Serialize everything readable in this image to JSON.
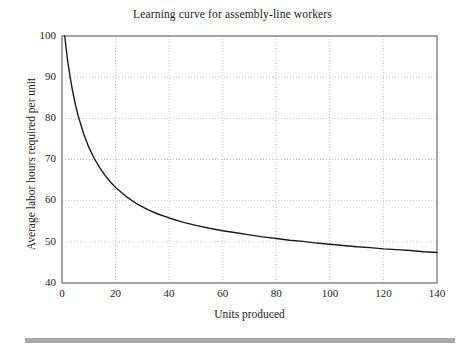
{
  "figure": {
    "title": "Learning curve for assembly-line workers",
    "footer_rule_color": "#a9a9a9"
  },
  "chart_data": {
    "type": "line",
    "title": "Learning curve for assembly-line workers",
    "xlabel": "Units produced",
    "ylabel": "Average labor hours required per unit",
    "xlim": [
      0,
      140
    ],
    "ylim": [
      40,
      100
    ],
    "xticks": [
      0,
      20,
      40,
      60,
      80,
      100,
      120,
      140
    ],
    "yticks": [
      40,
      50,
      60,
      70,
      80,
      90,
      100
    ],
    "grid": "dotted gridlines at x ticks 20-120 and y ticks 50-90",
    "legend": "none",
    "line_color": "#1a1a1a",
    "line_width": 1.4,
    "series": [
      {
        "name": "Average labor hours per unit",
        "x": [
          1,
          2,
          3,
          4,
          5,
          6,
          8,
          10,
          12,
          14,
          16,
          18,
          20,
          24,
          28,
          32,
          36,
          40,
          45,
          50,
          55,
          60,
          65,
          70,
          75,
          80,
          85,
          90,
          95,
          100,
          105,
          110,
          115,
          120,
          125,
          130,
          135,
          140
        ],
        "y": [
          100.0,
          94.5,
          90.1,
          86.5,
          83.4,
          80.7,
          76.4,
          73.0,
          70.3,
          68.1,
          66.2,
          64.6,
          63.2,
          61.0,
          59.2,
          57.8,
          56.7,
          55.8,
          54.8,
          54.0,
          53.3,
          52.7,
          52.2,
          51.7,
          51.2,
          50.8,
          50.4,
          50.1,
          49.7,
          49.4,
          49.1,
          48.8,
          48.6,
          48.3,
          48.1,
          47.9,
          47.6,
          47.4
        ]
      }
    ],
    "annotations": []
  },
  "axes": {
    "x_tick_labels": [
      "0",
      "20",
      "40",
      "60",
      "80",
      "100",
      "120",
      "140"
    ],
    "y_tick_labels": [
      "40",
      "50",
      "60",
      "70",
      "80",
      "90",
      "100"
    ],
    "x_axis_title": "Units produced",
    "y_axis_title": "Average labor hours required per unit"
  }
}
